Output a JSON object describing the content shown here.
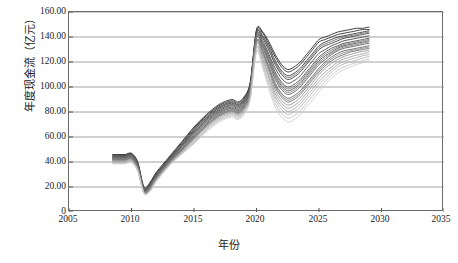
{
  "chart_data": {
    "type": "line",
    "title": "",
    "xlabel": "年份",
    "ylabel": "年度现金流（亿元）",
    "xlim": [
      2005,
      2035
    ],
    "ylim": [
      0,
      160
    ],
    "xticks": [
      "2005",
      "2010",
      "2015",
      "2020",
      "2025",
      "2030",
      "2035"
    ],
    "yticks": [
      "0",
      "20.00",
      "40.00",
      "60.00",
      "80.00",
      "100.00",
      "120.00",
      "140.00",
      "160.00"
    ],
    "grid": "horizontal",
    "legend": "none",
    "x": [
      2008.5,
      2009,
      2009.5,
      2010,
      2010.5,
      2011,
      2011.5,
      2012,
      2013,
      2014,
      2015,
      2016,
      2017,
      2018,
      2018.5,
      2019,
      2019.5,
      2020,
      2020.5,
      2021,
      2021.5,
      2022,
      2022.5,
      2023,
      2023.5,
      2024,
      2024.5,
      2025,
      2025.5,
      2026,
      2026.5,
      2027,
      2027.5,
      2028,
      2028.5,
      2029
    ],
    "series": [
      {
        "name": "情景01",
        "color": "#1c1c1c",
        "values": [
          46,
          46,
          46,
          47,
          40,
          20,
          24,
          32,
          44,
          56,
          68,
          78,
          86,
          90,
          88,
          92,
          104,
          146,
          144,
          136,
          126,
          118,
          114,
          116,
          120,
          126,
          132,
          138,
          140,
          142,
          144,
          145,
          146,
          147,
          147,
          148
        ]
      },
      {
        "name": "情景02",
        "color": "#242424",
        "values": [
          45.5,
          45.5,
          45.5,
          46.5,
          39,
          19,
          23,
          31,
          43,
          55,
          67,
          77,
          85,
          89,
          87,
          91,
          103,
          145,
          143,
          134,
          124,
          116,
          112,
          114,
          118,
          124,
          130,
          136,
          138,
          140,
          142,
          143,
          144,
          145,
          146,
          146
        ]
      },
      {
        "name": "情景03",
        "color": "#2c2c2c",
        "values": [
          45,
          45,
          45,
          46,
          38.5,
          18.5,
          22.5,
          30.5,
          42.5,
          54,
          66,
          76,
          84,
          88,
          86,
          90,
          102,
          144,
          141,
          132,
          121,
          113,
          109,
          111,
          115,
          121,
          127,
          133,
          136,
          138,
          140,
          141,
          142,
          143,
          144,
          145
        ]
      },
      {
        "name": "情景04",
        "color": "#343434",
        "values": [
          44.5,
          44.5,
          44.5,
          45.5,
          38,
          18,
          22,
          30,
          42,
          53,
          65,
          75,
          83,
          87,
          85,
          89,
          101,
          143,
          139,
          129,
          118,
          110,
          106,
          108,
          112,
          118,
          124,
          130,
          133,
          135,
          137,
          139,
          140,
          141,
          142,
          143
        ]
      },
      {
        "name": "情景05",
        "color": "#3c3c3c",
        "values": [
          44,
          44,
          44,
          45,
          37.5,
          17.5,
          21.5,
          29.5,
          41.5,
          52.5,
          64,
          74,
          82,
          86,
          84,
          88,
          100,
          142,
          137,
          126,
          115,
          107,
          103,
          105,
          109,
          115,
          121,
          127,
          130,
          133,
          135,
          137,
          138,
          139,
          140,
          141
        ]
      },
      {
        "name": "情景06",
        "color": "#444444",
        "values": [
          43.5,
          43.5,
          43.5,
          44.5,
          37,
          17,
          21,
          29,
          41,
          52,
          63,
          73,
          81,
          85,
          83,
          87,
          99,
          141,
          135,
          124,
          112,
          104,
          100,
          102,
          106,
          112,
          118,
          124,
          128,
          131,
          133,
          135,
          136,
          137,
          138,
          139
        ]
      },
      {
        "name": "情景07",
        "color": "#4c4c4c",
        "values": [
          43,
          43,
          43,
          44,
          36.5,
          16.8,
          20.5,
          28.5,
          40.5,
          51,
          62,
          72,
          80,
          84,
          82,
          86,
          98,
          140,
          133,
          121,
          109,
          101,
          97,
          99,
          103,
          109,
          115,
          121,
          125,
          128,
          131,
          133,
          134,
          135,
          136,
          137
        ]
      },
      {
        "name": "情景08",
        "color": "#545454",
        "values": [
          42.5,
          42.5,
          42.5,
          43.5,
          36,
          16.5,
          20,
          28,
          40,
          50,
          61,
          71,
          79,
          83,
          81,
          85,
          97,
          139,
          131,
          119,
          106,
          98,
          94,
          96,
          100,
          106,
          112,
          118,
          122,
          126,
          129,
          131,
          132,
          133,
          134,
          135
        ]
      },
      {
        "name": "情景09",
        "color": "#5c5c5c",
        "values": [
          42,
          42,
          42,
          43,
          35.5,
          16.2,
          19.5,
          27.5,
          39.5,
          49.5,
          60,
          70,
          78,
          82,
          80,
          84,
          96,
          137,
          129,
          116,
          103,
          95,
          91,
          93,
          97,
          103,
          109,
          115,
          120,
          124,
          127,
          129,
          130,
          131,
          132,
          133
        ]
      },
      {
        "name": "情景10",
        "color": "#646464",
        "values": [
          41.5,
          41.5,
          41.5,
          42.5,
          35,
          16,
          19,
          27,
          39,
          49,
          59,
          69,
          77,
          81,
          79,
          83,
          95,
          136,
          127,
          114,
          100,
          92,
          88,
          90,
          94,
          100,
          106,
          112,
          117,
          121,
          124,
          126,
          128,
          129,
          130,
          131
        ]
      },
      {
        "name": "情景11",
        "color": "#6c6c6c",
        "values": [
          44.8,
          44.8,
          44.8,
          45.8,
          38.2,
          18.2,
          22.2,
          30.2,
          42.2,
          53.5,
          65.5,
          75.5,
          83.5,
          87.5,
          85.5,
          89.5,
          101.5,
          143.5,
          140,
          130.5,
          119.5,
          111.5,
          107.5,
          109.5,
          113.5,
          119.5,
          125.5,
          131.5,
          134.5,
          136.5,
          138.5,
          140,
          141,
          142,
          143,
          144
        ]
      },
      {
        "name": "情景12",
        "color": "#757575",
        "values": [
          43.8,
          43.8,
          43.8,
          44.8,
          37.2,
          17.2,
          21.2,
          29.2,
          41.2,
          52.2,
          63.5,
          73.5,
          81.5,
          85.5,
          83.5,
          87.5,
          99.5,
          141.5,
          134,
          122.5,
          110.5,
          102.5,
          98.5,
          100.5,
          104.5,
          110.5,
          116.5,
          122.5,
          126.5,
          129.5,
          132,
          134,
          135,
          136,
          137,
          138
        ]
      },
      {
        "name": "情景13",
        "color": "#7e7e7e",
        "values": [
          42.8,
          42.8,
          42.8,
          43.8,
          36.2,
          16.6,
          20.2,
          28.2,
          40.2,
          50.5,
          61.5,
          71.5,
          79.5,
          83.5,
          81.5,
          85.5,
          97.5,
          139.5,
          132,
          120,
          107.5,
          99.5,
          95.5,
          97.5,
          101.5,
          107.5,
          113.5,
          119.5,
          123.5,
          127,
          130,
          132,
          133,
          134,
          135,
          136
        ]
      },
      {
        "name": "情景14",
        "color": "#878787",
        "values": [
          41.8,
          41.8,
          41.8,
          42.8,
          35.2,
          16.1,
          19.2,
          27.2,
          39.2,
          49.2,
          59.5,
          69.5,
          77.5,
          81.5,
          79.5,
          83.5,
          95.5,
          136.5,
          128,
          115,
          101.5,
          93.5,
          89.5,
          91.5,
          95.5,
          101.5,
          107.5,
          113.5,
          118.5,
          122.5,
          125.5,
          127.5,
          129,
          130,
          131,
          132
        ]
      },
      {
        "name": "情景15",
        "color": "#909090",
        "values": [
          41,
          41,
          41,
          42,
          34.6,
          15.8,
          18.6,
          26.6,
          38.6,
          48.5,
          58.5,
          68.5,
          76.5,
          80.5,
          78.5,
          82.5,
          94.5,
          135,
          125,
          112,
          97.5,
          89.5,
          85.5,
          87.5,
          91.5,
          97.5,
          103.5,
          110,
          115,
          119,
          122,
          124.5,
          126,
          127.5,
          128.5,
          129.5
        ]
      },
      {
        "name": "情景16",
        "color": "#9b9b9b",
        "values": [
          40.5,
          40.5,
          40.5,
          41.5,
          34.2,
          15.6,
          18.2,
          26.2,
          38.2,
          48,
          58,
          68,
          76,
          80,
          78,
          82,
          94,
          134,
          123,
          109,
          95,
          87,
          83,
          85,
          89,
          95,
          101,
          107,
          112,
          116,
          120,
          122.5,
          124,
          125.5,
          126.5,
          128
        ]
      },
      {
        "name": "情景17",
        "color": "#a6a6a6",
        "values": [
          40,
          40,
          40,
          41,
          33.8,
          15.4,
          17.8,
          25.8,
          37.8,
          47.5,
          57,
          67,
          75,
          79,
          77,
          81,
          93,
          132,
          121,
          107,
          92.5,
          84.5,
          80.5,
          82.5,
          86.5,
          92.5,
          98.5,
          104.5,
          109.5,
          114,
          118,
          120.5,
          122,
          123.5,
          125,
          126
        ]
      },
      {
        "name": "情景18",
        "color": "#b2b2b2",
        "values": [
          39.5,
          39.5,
          39.5,
          40.5,
          33.4,
          15.2,
          17.4,
          25.4,
          37.4,
          47,
          56,
          66,
          74,
          78,
          76,
          80,
          92,
          131,
          119,
          104,
          90,
          82,
          78,
          80,
          84,
          90,
          96,
          102,
          107,
          112,
          116,
          118.5,
          120,
          121.5,
          123,
          124.5
        ]
      },
      {
        "name": "情景19",
        "color": "#bfbfbf",
        "values": [
          39,
          39,
          39,
          40,
          33,
          15,
          17,
          25,
          37,
          46.5,
          55,
          65,
          73,
          77,
          75,
          79,
          91,
          129,
          117,
          101,
          87,
          79,
          75,
          77,
          81,
          87,
          93,
          99,
          104.5,
          109.5,
          113.5,
          116,
          118,
          119.5,
          121,
          122.5
        ]
      },
      {
        "name": "情景20",
        "color": "#cccccc",
        "values": [
          38.5,
          38.5,
          38.5,
          39.5,
          32.6,
          14.8,
          16.6,
          24.6,
          36.6,
          46,
          54.5,
          64,
          72,
          76,
          74,
          78,
          90,
          128,
          115,
          98,
          84,
          76,
          72,
          74,
          78,
          84,
          90,
          96,
          102,
          107,
          111,
          114,
          116,
          118,
          119.5,
          121
        ]
      }
    ]
  }
}
